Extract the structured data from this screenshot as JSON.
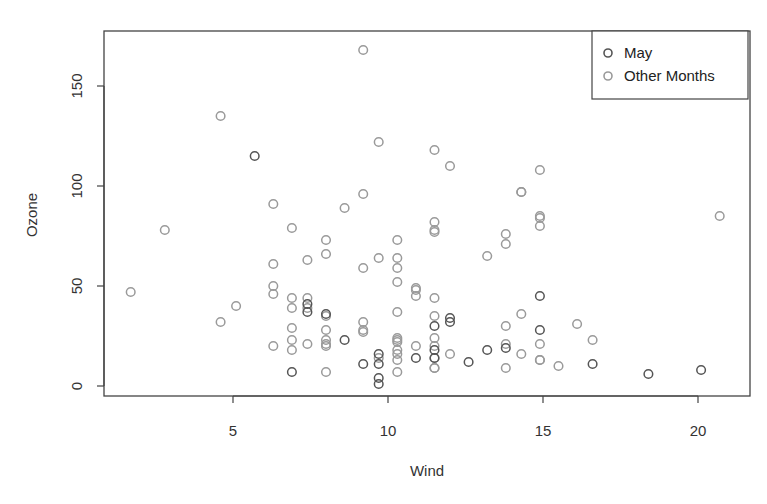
{
  "chart_data": {
    "type": "scatter",
    "title": "",
    "xlabel": "Wind",
    "ylabel": "Ozone",
    "xlim": [
      1.7,
      21.4
    ],
    "ylim": [
      -6,
      175
    ],
    "x_ticks": [
      5,
      10,
      15,
      20
    ],
    "y_ticks": [
      0,
      50,
      100,
      150
    ],
    "grid": false,
    "legend_position": "topright",
    "legend": [
      {
        "label": "May",
        "color": "#555555"
      },
      {
        "label": "Other Months",
        "color": "#9a9a9a"
      }
    ],
    "series": [
      {
        "name": "May",
        "color": "#555555",
        "points": [
          [
            7.4,
            41
          ],
          [
            8.0,
            36
          ],
          [
            12.6,
            12
          ],
          [
            11.5,
            18
          ],
          [
            14.9,
            28
          ],
          [
            8.6,
            23
          ],
          [
            13.8,
            19
          ],
          [
            20.1,
            8
          ],
          [
            6.9,
            7
          ],
          [
            9.7,
            16
          ],
          [
            9.2,
            11
          ],
          [
            10.9,
            14
          ],
          [
            13.2,
            18
          ],
          [
            11.5,
            14
          ],
          [
            12.0,
            34
          ],
          [
            18.4,
            6
          ],
          [
            11.5,
            30
          ],
          [
            9.7,
            11
          ],
          [
            9.7,
            1
          ],
          [
            16.6,
            11
          ],
          [
            9.7,
            4
          ],
          [
            12.0,
            32
          ],
          [
            14.9,
            45
          ],
          [
            5.7,
            115
          ],
          [
            7.4,
            37
          ]
        ]
      },
      {
        "name": "Other Months",
        "color": "#9a9a9a",
        "points": [
          [
            6.9,
            29
          ],
          [
            13.8,
            71
          ],
          [
            7.4,
            39
          ],
          [
            6.9,
            23
          ],
          [
            7.4,
            21
          ],
          [
            10.3,
            37
          ],
          [
            8.0,
            20
          ],
          [
            4.6,
            135
          ],
          [
            10.9,
            49
          ],
          [
            9.2,
            32
          ],
          [
            10.3,
            64
          ],
          [
            5.1,
            40
          ],
          [
            11.5,
            77
          ],
          [
            14.3,
            97
          ],
          [
            14.3,
            97
          ],
          [
            14.9,
            85
          ],
          [
            15.5,
            10
          ],
          [
            9.2,
            27
          ],
          [
            10.3,
            7
          ],
          [
            10.9,
            48
          ],
          [
            8.0,
            35
          ],
          [
            6.3,
            61
          ],
          [
            6.9,
            79
          ],
          [
            7.4,
            63
          ],
          [
            14.3,
            16
          ],
          [
            14.9,
            80
          ],
          [
            14.9,
            108
          ],
          [
            11.5,
            20
          ],
          [
            10.3,
            52
          ],
          [
            11.5,
            82
          ],
          [
            6.3,
            50
          ],
          [
            9.7,
            64
          ],
          [
            9.2,
            59
          ],
          [
            6.9,
            39
          ],
          [
            13.8,
            9
          ],
          [
            10.3,
            16
          ],
          [
            2.8,
            78
          ],
          [
            11.5,
            35
          ],
          [
            8.0,
            66
          ],
          [
            9.7,
            122
          ],
          [
            8.6,
            89
          ],
          [
            12.0,
            110
          ],
          [
            7.4,
            44
          ],
          [
            9.2,
            28
          ],
          [
            13.2,
            65
          ],
          [
            10.3,
            22
          ],
          [
            10.3,
            59
          ],
          [
            10.3,
            23
          ],
          [
            16.1,
            31
          ],
          [
            6.9,
            44
          ],
          [
            13.8,
            21
          ],
          [
            11.5,
            9
          ],
          [
            10.9,
            45
          ],
          [
            9.2,
            168
          ],
          [
            8.0,
            73
          ],
          [
            13.8,
            76
          ],
          [
            11.5,
            118
          ],
          [
            14.9,
            84
          ],
          [
            20.7,
            85
          ],
          [
            9.2,
            96
          ],
          [
            11.5,
            78
          ],
          [
            10.3,
            73
          ],
          [
            6.3,
            91
          ],
          [
            1.7,
            47
          ],
          [
            4.6,
            32
          ],
          [
            6.3,
            20
          ],
          [
            8.0,
            23
          ],
          [
            8.0,
            21
          ],
          [
            10.3,
            24
          ],
          [
            11.5,
            44
          ],
          [
            14.9,
            21
          ],
          [
            8.0,
            28
          ],
          [
            11.5,
            9
          ],
          [
            10.3,
            13
          ],
          [
            6.3,
            46
          ],
          [
            6.9,
            18
          ],
          [
            14.9,
            13
          ],
          [
            11.5,
            24
          ],
          [
            12.0,
            16
          ],
          [
            14.9,
            13
          ],
          [
            16.6,
            23
          ],
          [
            14.3,
            36
          ],
          [
            8.0,
            7
          ],
          [
            11.5,
            14
          ],
          [
            13.8,
            30
          ],
          [
            9.7,
            14
          ],
          [
            10.3,
            18
          ],
          [
            10.9,
            20
          ]
        ]
      }
    ]
  }
}
